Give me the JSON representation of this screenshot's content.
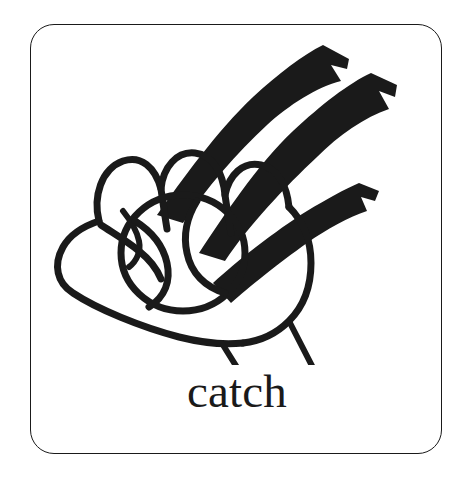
{
  "card": {
    "border_color": "#1a1a1a",
    "background_color": "#ffffff",
    "corner_radius_px": 24
  },
  "pictogram": {
    "name": "hand-catching-ball-line-drawing",
    "description": "Black line drawing of an open hand catching a ball, with three motion streak lines at upper right and two wrist lines below",
    "ink_color": "#1a1a1a",
    "elements": [
      "hand-outline",
      "thumb",
      "four-fingers",
      "ball",
      "ball-seam-left",
      "ball-seam-right",
      "motion-streak-1",
      "motion-streak-2",
      "motion-streak-3",
      "wrist-line-left",
      "wrist-line-right"
    ]
  },
  "caption": {
    "text": "catch",
    "color": "#1a1a1a"
  }
}
